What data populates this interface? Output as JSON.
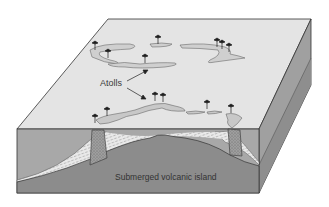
{
  "diagram": {
    "labels": {
      "atolls": "Atolls",
      "island": "Submerged volcanic island"
    },
    "colors": {
      "background": "#ffffff",
      "sea_surface": "#e4e4e4",
      "water_front": "#a6a6a6",
      "island_rock": "#8c8c8c",
      "right_face": "#9a9a9a",
      "reef": "#c8c8c8",
      "outline": "#333333",
      "palm": "#1e1e1e"
    },
    "components": [
      {
        "name": "upper-atoll-ring",
        "palm_trees": 7
      },
      {
        "name": "lower-atoll-ring",
        "palm_trees": 7
      },
      {
        "name": "reef-column-left"
      },
      {
        "name": "reef-column-right"
      },
      {
        "name": "submerged-volcanic-island"
      }
    ]
  }
}
